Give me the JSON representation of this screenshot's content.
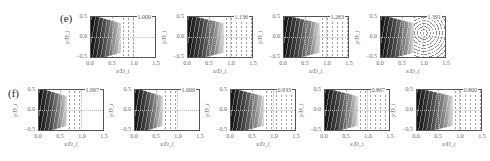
{
  "figure": {
    "rows": [
      {
        "label": "(e)",
        "panels": [
          {
            "value": "1.000",
            "wedge_frac": 0.45,
            "mode": "sparse"
          },
          {
            "value": "1.136",
            "wedge_frac": 0.55,
            "mode": "streaks"
          },
          {
            "value": "1.263",
            "wedge_frac": 0.55,
            "mode": "streaks"
          },
          {
            "value": "1.391",
            "wedge_frac": 0.5,
            "mode": "turbulent"
          }
        ]
      },
      {
        "label": "(f)",
        "panels": [
          {
            "value": "1.067",
            "wedge_frac": 0.42,
            "mode": "sparse"
          },
          {
            "value": "1.000",
            "wedge_frac": 0.42,
            "mode": "sparse"
          },
          {
            "value": "0.933",
            "wedge_frac": 0.5,
            "mode": "streaks"
          },
          {
            "value": "0.867",
            "wedge_frac": 0.5,
            "mode": "streaks"
          },
          {
            "value": "0.800",
            "wedge_frac": 0.55,
            "mode": "streaks"
          }
        ]
      }
    ],
    "axes": {
      "xlabel": "x/D_i",
      "ylabel": "y/D_i",
      "xticks": [
        "0.0",
        "0.5",
        "1.0",
        "1.5"
      ],
      "yticks": [
        "0.5",
        "0.0",
        "−0.5"
      ],
      "xlim": [
        0.0,
        1.5
      ],
      "ylim": [
        -0.5,
        0.5
      ]
    }
  }
}
